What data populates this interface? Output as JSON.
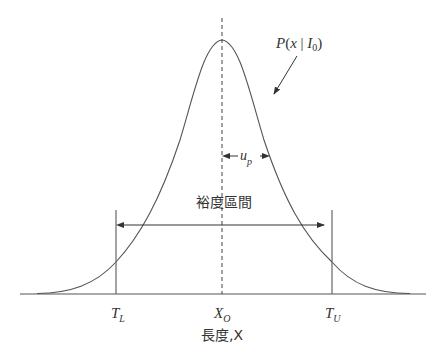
{
  "figure": {
    "curve_label": {
      "P": "P",
      "open": "(",
      "x": "x",
      "bar": " | ",
      "I": "I",
      "sub": "0",
      "close": ")"
    },
    "up_label": {
      "u": "u",
      "sub": "p"
    },
    "interval_label": "裕度區間",
    "ticks": [
      {
        "main": "T",
        "sub": "L"
      },
      {
        "main": "X",
        "sub": "O"
      },
      {
        "main": "T",
        "sub": "U"
      }
    ],
    "xlabel": "長度,X",
    "colors": {
      "line": "#444444",
      "background": "#ffffff",
      "text": "#333333"
    }
  }
}
